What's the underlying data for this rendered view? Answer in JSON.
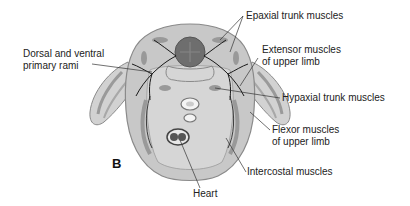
{
  "figure": {
    "panel_letter": "B",
    "labels": {
      "epaxial": "Epaxial trunk muscles",
      "extensor_1": "Extensor muscles",
      "extensor_2": "of upper limb",
      "dorsal_1": "Dorsal and ventral",
      "dorsal_2": "primary rami",
      "hypaxial": "Hypaxial trunk muscles",
      "flexor_1": "Flexor muscles",
      "flexor_2": "of upper limb",
      "intercostal": "Intercostal muscles",
      "heart": "Heart"
    },
    "colors": {
      "body_fill": "#c8c8c8",
      "body_stroke": "#8a8a8a",
      "muscle": "#8f8f8f",
      "spinal_cord": "#6e6e6e",
      "nerve": "#1a1a1a",
      "leader": "#333333"
    }
  }
}
